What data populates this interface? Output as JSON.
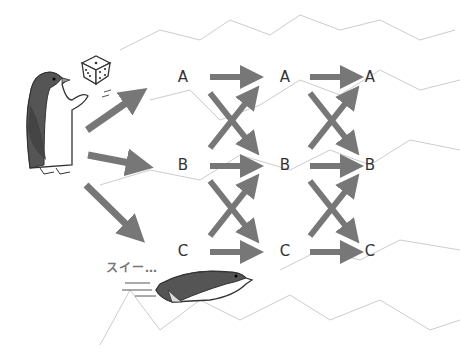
{
  "diagram": {
    "type": "state-transition",
    "states": [
      "A",
      "B",
      "C"
    ],
    "columns": [
      {
        "labels": [
          "A",
          "B",
          "C"
        ]
      },
      {
        "labels": [
          "A",
          "B",
          "C"
        ]
      },
      {
        "labels": [
          "A",
          "B",
          "C"
        ]
      }
    ],
    "sound_effect": "スイー…",
    "arrow_color": "#777777",
    "mountain_color": "#cccccc"
  }
}
